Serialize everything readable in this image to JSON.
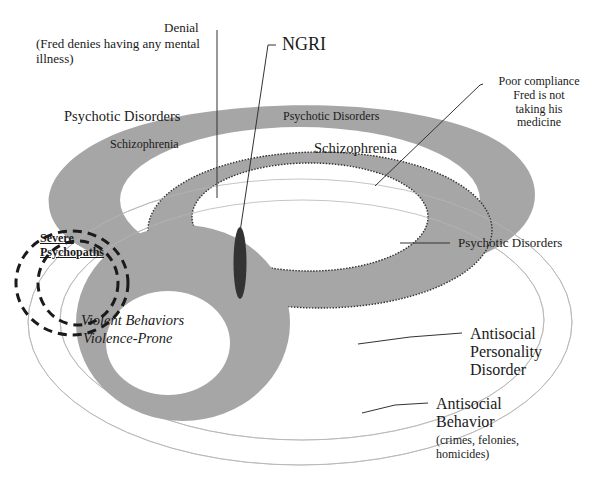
{
  "colors": {
    "band_fill": "#a6a6a6",
    "background": "#ffffff",
    "text": "#1a1a1a",
    "ngri_marker": "#333333",
    "outer_ellipse_stroke": "#b0b0b0"
  },
  "labels": {
    "denial_title": "Denial",
    "denial_sub_line1": "(Fred denies having any mental",
    "denial_sub_line2": "illness)",
    "ngri": "NGRI",
    "poor_compliance_line1": "Poor compliance",
    "poor_compliance_line2": "Fred is not",
    "poor_compliance_line3": "taking his",
    "poor_compliance_line4": "medicine",
    "psychotic_left": "Psychotic Disorders",
    "psychotic_top": "Psychotic Disorders",
    "psychotic_right": "Psychotic Disorders",
    "schizophrenia_left": "Schizophrenia",
    "schizophrenia_right": "Schizophrenia",
    "severe_line1": "Severe",
    "severe_line2": "Psychopaths",
    "violent_line1": "Violent Behaviors",
    "violent_line2": "Violence-Prone",
    "aspd_line1": "Antisocial",
    "aspd_line2": "Personality",
    "aspd_line3": "Disorder",
    "asb_line1": "Antisocial",
    "asb_line2": "Behavior",
    "asb_sub_line1": "(crimes, felonies,",
    "asb_sub_line2": "homicides)"
  }
}
